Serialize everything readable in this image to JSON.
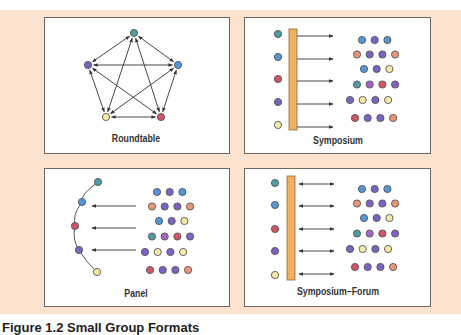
{
  "figure": {
    "caption_clipped": "Figure 1.2  Small Group Formats"
  },
  "colors": {
    "background": "#fbe3cf",
    "bar": "#f0b060",
    "teal": "#4f9ca3",
    "blue": "#5497d6",
    "red": "#d25565",
    "purple": "#7b63c4",
    "magenta": "#a565c8",
    "yellow": "#f6e9a6",
    "salmon": "#eb9477"
  },
  "panels": [
    {
      "id": "roundtable",
      "label": "Roundtable"
    },
    {
      "id": "symposium",
      "label": "Symposium"
    },
    {
      "id": "panel",
      "label": "Panel"
    },
    {
      "id": "symposium-forum",
      "label": "Symposium–Forum"
    }
  ],
  "audience_rows": [
    [
      "blue",
      "purple",
      "blue"
    ],
    [
      "salmon",
      "purple",
      "purple",
      "salmon"
    ],
    [
      "blue",
      "purple",
      "yellow"
    ],
    [
      "teal",
      "magenta",
      "red",
      "purple"
    ],
    [
      "purple",
      "yellow",
      "purple",
      "yellow"
    ],
    [
      "red",
      "purple",
      "purple",
      "salmon"
    ]
  ],
  "speakers": [
    "teal",
    "blue",
    "red",
    "purple",
    "yellow"
  ]
}
